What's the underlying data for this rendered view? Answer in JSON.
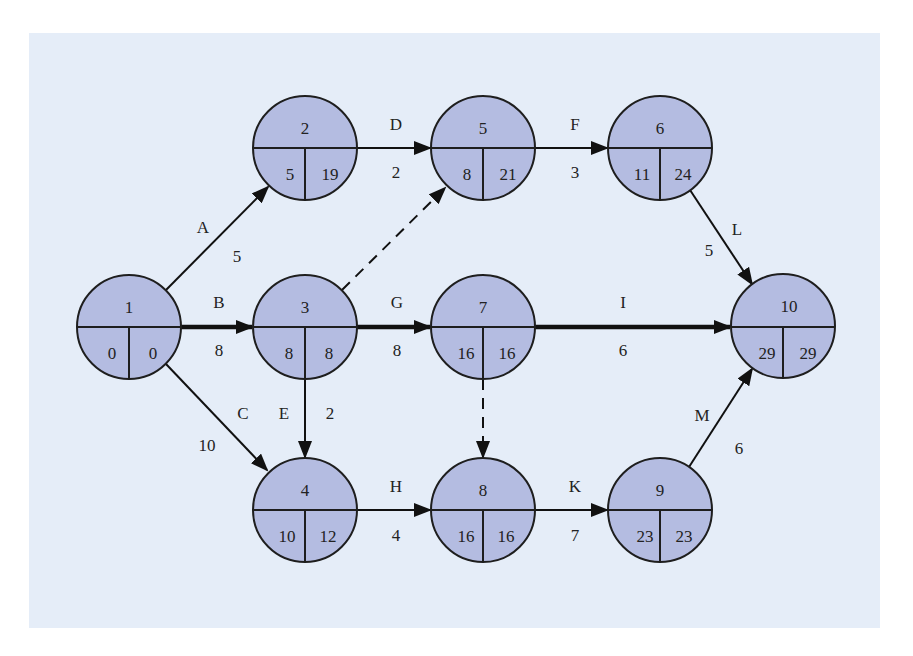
{
  "diagram": {
    "type": "activity-on-arrow network (critical path)",
    "colors": {
      "background": "#e5edf8",
      "node_fill": "#b4bce1",
      "stroke": "#1e1e1e"
    },
    "nodes": [
      {
        "id": "1",
        "cx": 129,
        "cy": 327,
        "early": "0",
        "late": "0"
      },
      {
        "id": "2",
        "cx": 305,
        "cy": 148,
        "early": "5",
        "late": "19"
      },
      {
        "id": "3",
        "cx": 305,
        "cy": 327,
        "early": "8",
        "late": "8"
      },
      {
        "id": "4",
        "cx": 305,
        "cy": 510,
        "early": "10",
        "late": "12"
      },
      {
        "id": "5",
        "cx": 483,
        "cy": 148,
        "early": "8",
        "late": "21"
      },
      {
        "id": "6",
        "cx": 660,
        "cy": 148,
        "early": "11",
        "late": "24"
      },
      {
        "id": "7",
        "cx": 483,
        "cy": 327,
        "early": "16",
        "late": "16"
      },
      {
        "id": "8",
        "cx": 483,
        "cy": 510,
        "early": "16",
        "late": "16"
      },
      {
        "id": "9",
        "cx": 660,
        "cy": 510,
        "early": "23",
        "late": "23"
      },
      {
        "id": "10",
        "cx": 783,
        "cy": 326,
        "early": "29",
        "late": "29"
      }
    ],
    "edges": [
      {
        "activity": "A",
        "duration": "5",
        "from": "1",
        "to": "2",
        "style": "normal"
      },
      {
        "activity": "B",
        "duration": "8",
        "from": "1",
        "to": "3",
        "style": "critical"
      },
      {
        "activity": "C",
        "duration": "10",
        "from": "1",
        "to": "4",
        "style": "normal"
      },
      {
        "activity": "D",
        "duration": "2",
        "from": "2",
        "to": "5",
        "style": "normal"
      },
      {
        "activity": "",
        "duration": "",
        "from": "3",
        "to": "5",
        "style": "dummy"
      },
      {
        "activity": "E",
        "duration": "2",
        "from": "3",
        "to": "4",
        "style": "normal"
      },
      {
        "activity": "G",
        "duration": "8",
        "from": "3",
        "to": "7",
        "style": "critical"
      },
      {
        "activity": "F",
        "duration": "3",
        "from": "5",
        "to": "6",
        "style": "normal"
      },
      {
        "activity": "L",
        "duration": "5",
        "from": "6",
        "to": "10",
        "style": "normal"
      },
      {
        "activity": "I",
        "duration": "6",
        "from": "7",
        "to": "10",
        "style": "critical"
      },
      {
        "activity": "",
        "duration": "",
        "from": "7",
        "to": "8",
        "style": "dummy"
      },
      {
        "activity": "H",
        "duration": "4",
        "from": "4",
        "to": "8",
        "style": "normal"
      },
      {
        "activity": "K",
        "duration": "7",
        "from": "8",
        "to": "9",
        "style": "normal"
      },
      {
        "activity": "M",
        "duration": "6",
        "from": "9",
        "to": "10",
        "style": "normal"
      }
    ],
    "edge_labels": {
      "A": {
        "letter": "A",
        "dur": "5"
      },
      "B": {
        "letter": "B",
        "dur": "8"
      },
      "C": {
        "letter": "C",
        "dur": "10"
      },
      "D": {
        "letter": "D",
        "dur": "2"
      },
      "E": {
        "letter": "E",
        "dur": "2"
      },
      "F": {
        "letter": "F",
        "dur": "3"
      },
      "G": {
        "letter": "G",
        "dur": "8"
      },
      "H": {
        "letter": "H",
        "dur": "4"
      },
      "I": {
        "letter": "I",
        "dur": "6"
      },
      "K": {
        "letter": "K",
        "dur": "7"
      },
      "L": {
        "letter": "L",
        "dur": "5"
      },
      "M": {
        "letter": "M",
        "dur": "6"
      }
    },
    "node_labels": {
      "n1": {
        "id": "1",
        "early": "0",
        "late": "0"
      },
      "n2": {
        "id": "2",
        "early": "5",
        "late": "19"
      },
      "n3": {
        "id": "3",
        "early": "8",
        "late": "8"
      },
      "n4": {
        "id": "4",
        "early": "10",
        "late": "12"
      },
      "n5": {
        "id": "5",
        "early": "8",
        "late": "21"
      },
      "n6": {
        "id": "6",
        "early": "11",
        "late": "24"
      },
      "n7": {
        "id": "7",
        "early": "16",
        "late": "16"
      },
      "n8": {
        "id": "8",
        "early": "16",
        "late": "16"
      },
      "n9": {
        "id": "9",
        "early": "23",
        "late": "23"
      },
      "n10": {
        "id": "10",
        "early": "29",
        "late": "29"
      }
    }
  }
}
